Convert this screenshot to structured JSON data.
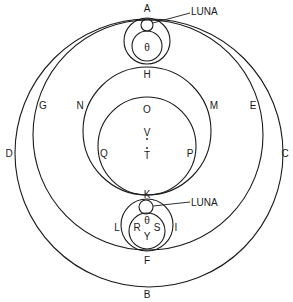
{
  "diagram": {
    "type": "astronomical orbit diagram",
    "labels": {
      "A": "A",
      "B": "B",
      "C": "C",
      "D": "D",
      "E": "E",
      "F": "F",
      "G": "G",
      "H": "H",
      "I": "I",
      "K": "K",
      "L": "L",
      "M": "M",
      "N": "N",
      "O": "O",
      "P": "P",
      "Q": "Q",
      "R": "R",
      "S": "S",
      "T": "T",
      "V": "V",
      "Y": "Y",
      "theta_top": "θ",
      "theta_bottom": "θ",
      "luna_top": "LUNA",
      "luna_bottom": "LUNA"
    }
  }
}
